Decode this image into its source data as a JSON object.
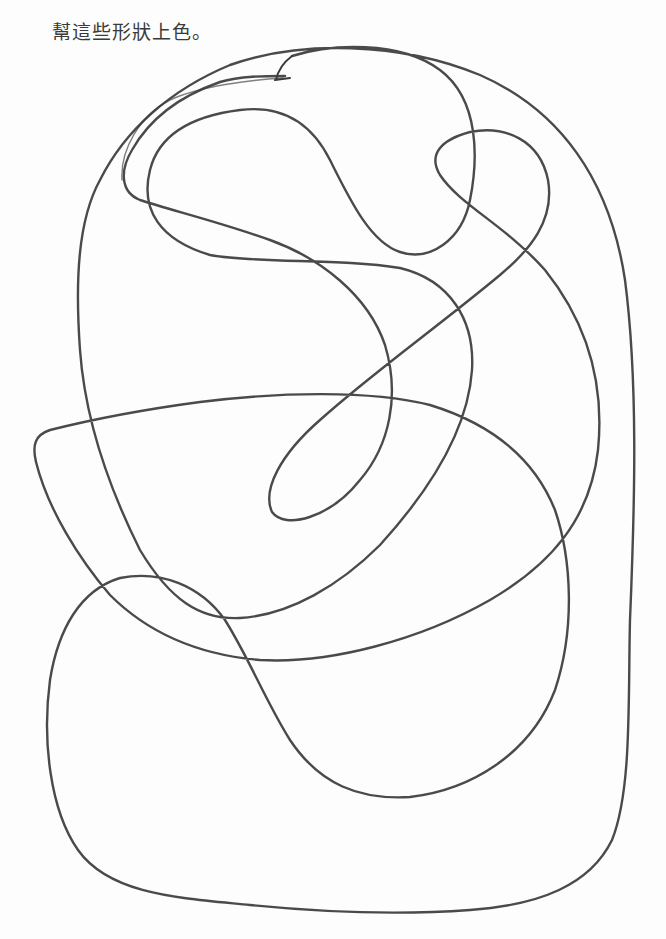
{
  "worksheet": {
    "instruction": "幫這些形狀上色。",
    "drawing": {
      "description": "One continuous closed pencil scribble line forming many overlapping regions to color in",
      "stroke_color": "#3b3b3b",
      "background_color": "#fdfdfd"
    }
  }
}
